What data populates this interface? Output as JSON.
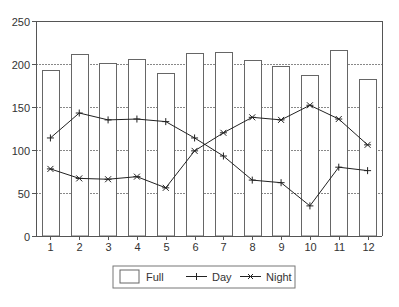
{
  "chart_data": {
    "type": "bar+line",
    "title": "",
    "xlabel": "",
    "ylabel": "",
    "categories": [
      "1",
      "2",
      "3",
      "4",
      "5",
      "6",
      "7",
      "8",
      "9",
      "10",
      "11",
      "12"
    ],
    "ylim": [
      0,
      250
    ],
    "yticks": [
      0,
      50,
      100,
      150,
      200,
      250
    ],
    "grid": true,
    "legend_position": "bottom",
    "series": [
      {
        "name": "Full",
        "type": "bar",
        "values": [
          193,
          212,
          201,
          206,
          190,
          213,
          214,
          205,
          198,
          187,
          216,
          183
        ]
      },
      {
        "name": "Day",
        "type": "line",
        "marker": "plus",
        "values": [
          114,
          143,
          135,
          136,
          133,
          114,
          93,
          65,
          62,
          35,
          80,
          76
        ]
      },
      {
        "name": "Night",
        "type": "line",
        "marker": "asterisk",
        "values": [
          78,
          67,
          66,
          69,
          56,
          99,
          120,
          138,
          135,
          152,
          136,
          106
        ]
      }
    ]
  },
  "legend": {
    "items": [
      {
        "label": "Full",
        "symbol": "box"
      },
      {
        "label": "Day",
        "symbol": "line-plus"
      },
      {
        "label": "Night",
        "symbol": "line-asterisk"
      }
    ]
  },
  "colors": {
    "axis": "#555555",
    "bar_stroke": "#666666",
    "bar_fill": "#ffffff",
    "grid": "#888888",
    "line": "#222222",
    "text": "#333333"
  }
}
